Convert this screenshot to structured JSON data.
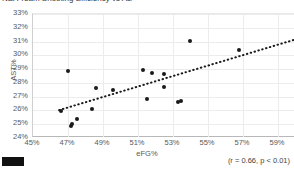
{
  "title_sliver": "NBA Team Shooting Efficiency vs Assist Rate",
  "legend_swatch_color": "#111111",
  "annotation": "(r = 0.66, p < 0.01)",
  "chart_data": {
    "type": "scatter",
    "title": "",
    "xlabel": "eFG%",
    "ylabel": "AST%",
    "xlim": [
      45,
      60
    ],
    "ylim": [
      24,
      33
    ],
    "xticks": [
      "45%",
      "47%",
      "49%",
      "51%",
      "53%",
      "55%",
      "57%",
      "59%"
    ],
    "xtick_values": [
      45,
      47,
      49,
      51,
      53,
      55,
      57,
      59
    ],
    "yticks": [
      "24%",
      "25%",
      "26%",
      "27%",
      "28%",
      "29%",
      "30%",
      "31%",
      "32%",
      "33%"
    ],
    "ytick_values": [
      24,
      25,
      26,
      27,
      28,
      29,
      30,
      31,
      32,
      33
    ],
    "grid": true,
    "legend": "none",
    "marker_color": "#1a1a1a",
    "points": [
      {
        "x": 46.6,
        "y": 25.95
      },
      {
        "x": 47.0,
        "y": 28.85
      },
      {
        "x": 47.2,
        "y": 24.85
      },
      {
        "x": 47.25,
        "y": 25.05
      },
      {
        "x": 47.5,
        "y": 25.35
      },
      {
        "x": 48.4,
        "y": 26.1
      },
      {
        "x": 48.6,
        "y": 27.65
      },
      {
        "x": 49.6,
        "y": 27.45
      },
      {
        "x": 51.3,
        "y": 28.95
      },
      {
        "x": 51.5,
        "y": 26.85
      },
      {
        "x": 51.8,
        "y": 28.7
      },
      {
        "x": 52.5,
        "y": 28.65
      },
      {
        "x": 52.5,
        "y": 27.7
      },
      {
        "x": 53.3,
        "y": 26.6
      },
      {
        "x": 53.45,
        "y": 26.65
      },
      {
        "x": 54.0,
        "y": 31.05
      },
      {
        "x": 56.8,
        "y": 30.4
      }
    ],
    "trendline": {
      "style": "dotted",
      "color": "#1a1a1a",
      "x_start": 46.55,
      "y_start": 25.95,
      "x_end": 60.0,
      "y_end": 31.05
    },
    "correlation": {
      "r": 0.66,
      "p": "< 0.01"
    }
  }
}
